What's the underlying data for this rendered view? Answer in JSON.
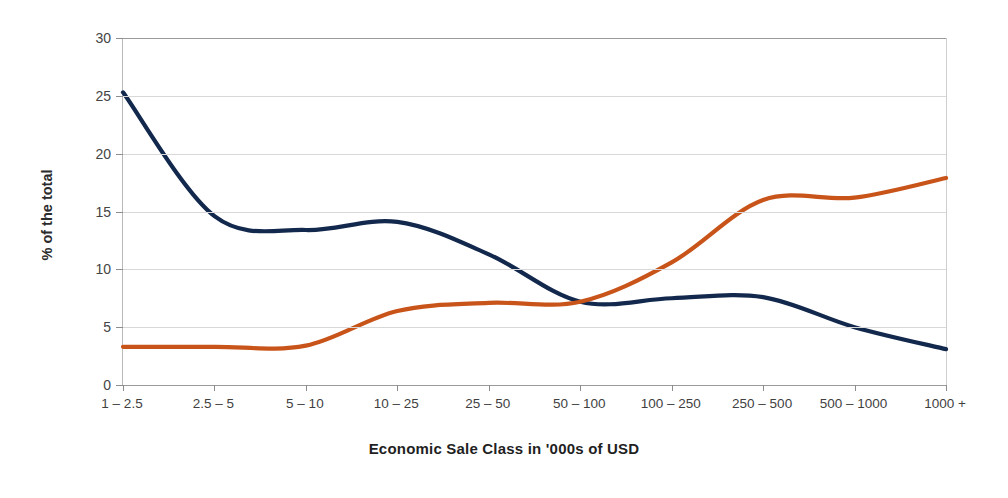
{
  "chart_data": {
    "type": "line",
    "title": "",
    "xlabel": "Economic Sale Class in '000s of USD",
    "ylabel": "% of the total",
    "categories": [
      "1 – 2.5",
      "2.5 – 5",
      "5 – 10",
      "10 – 25",
      "25 – 50",
      "50 – 100",
      "100 – 250",
      "250 – 500",
      "500 – 1000",
      "1000 +"
    ],
    "ylim": [
      0,
      30
    ],
    "yticks": [
      0,
      5,
      10,
      15,
      20,
      25,
      30
    ],
    "ytick_labels": [
      "0",
      "5",
      "10",
      "15",
      "20",
      "25",
      "30"
    ],
    "grid": true,
    "legend": "none",
    "series": [
      {
        "name": "navy-series",
        "color": "#12284c",
        "values": [
          25.3,
          14.6,
          13.4,
          14.1,
          11.3,
          7.2,
          7.5,
          7.6,
          5.0,
          3.1
        ]
      },
      {
        "name": "orange-series",
        "color": "#c8541a",
        "values": [
          3.3,
          3.3,
          3.4,
          6.4,
          7.1,
          7.2,
          10.6,
          16.0,
          16.2,
          17.9
        ]
      }
    ]
  }
}
